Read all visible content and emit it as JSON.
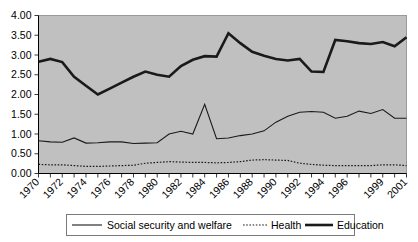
{
  "chart_data": {
    "type": "line",
    "title": "",
    "xlabel": "",
    "ylabel": "",
    "ylim": [
      0.0,
      4.0
    ],
    "ytick_step": 0.5,
    "grid": false,
    "legend_position": "bottom",
    "plot_background": "#c0c0c0",
    "line_color": "#1a1a1a",
    "ytick_labels": [
      "0.00",
      "0.50",
      "1.00",
      "1.50",
      "2.00",
      "2.50",
      "3.00",
      "3.50",
      "4.00"
    ],
    "ytick_values": [
      0.0,
      0.5,
      1.0,
      1.5,
      2.0,
      2.5,
      3.0,
      3.5,
      4.0
    ],
    "x": [
      1970,
      1971,
      1972,
      1973,
      1974,
      1975,
      1976,
      1977,
      1978,
      1979,
      1980,
      1981,
      1982,
      1983,
      1984,
      1985,
      1986,
      1987,
      1988,
      1989,
      1990,
      1991,
      1992,
      1993,
      1994,
      1995,
      1996,
      1997,
      1998,
      1999,
      2000,
      2001
    ],
    "xtick_labels": [
      "1970",
      "",
      "1972",
      "",
      "1974",
      "",
      "1976",
      "",
      "1978",
      "",
      "1980",
      "",
      "1982",
      "",
      "1984",
      "",
      "1986",
      "",
      "1988",
      "",
      "1990",
      "",
      "1992",
      "",
      "1994",
      "",
      "1996",
      "",
      "",
      "1999",
      "",
      "2001"
    ],
    "series": [
      {
        "name": "Social security and welfare",
        "style": "thin-solid",
        "values": [
          0.83,
          0.8,
          0.79,
          0.9,
          0.77,
          0.78,
          0.8,
          0.8,
          0.76,
          0.77,
          0.78,
          1.0,
          1.07,
          1.0,
          1.75,
          0.88,
          0.9,
          0.96,
          1.0,
          1.08,
          1.3,
          1.45,
          1.55,
          1.57,
          1.55,
          1.4,
          1.45,
          1.58,
          1.52,
          1.62,
          1.4,
          1.4
        ]
      },
      {
        "name": "Health",
        "style": "dotted",
        "values": [
          0.23,
          0.22,
          0.22,
          0.2,
          0.18,
          0.18,
          0.19,
          0.2,
          0.21,
          0.26,
          0.28,
          0.3,
          0.29,
          0.28,
          0.28,
          0.27,
          0.28,
          0.3,
          0.34,
          0.35,
          0.34,
          0.33,
          0.26,
          0.23,
          0.21,
          0.2,
          0.2,
          0.2,
          0.2,
          0.22,
          0.22,
          0.2
        ]
      },
      {
        "name": "Education",
        "style": "thick-solid",
        "values": [
          2.83,
          2.9,
          2.82,
          2.45,
          2.22,
          2.0,
          2.15,
          2.3,
          2.45,
          2.58,
          2.5,
          2.45,
          2.72,
          2.88,
          2.97,
          2.96,
          3.55,
          3.3,
          3.08,
          2.98,
          2.9,
          2.86,
          2.9,
          2.58,
          2.57,
          3.38,
          3.35,
          3.3,
          3.28,
          3.33,
          3.22,
          3.45
        ]
      }
    ]
  },
  "legend": {
    "items": [
      {
        "label": "Social security and welfare",
        "style": "thin-solid"
      },
      {
        "label": "Health",
        "style": "dotted"
      },
      {
        "label": "Education",
        "style": "thick-solid"
      }
    ]
  }
}
